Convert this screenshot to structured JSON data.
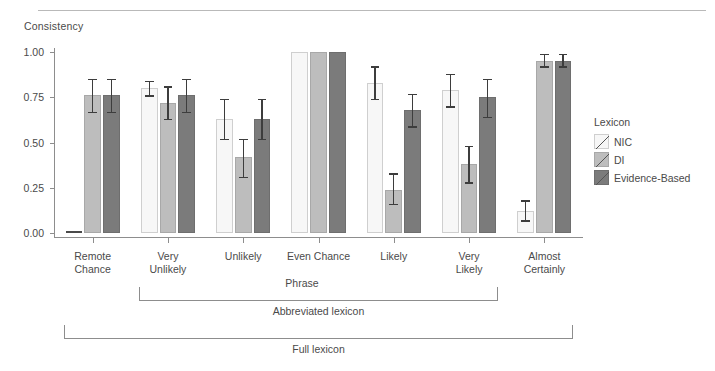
{
  "figure": {
    "top_fragment": "",
    "y_axis_title": "Consistency",
    "x_axis_title": "Phrase"
  },
  "legend": {
    "title": "Lexicon",
    "items": [
      {
        "label": "NIC",
        "color": "#f7f7f7",
        "key": "nic"
      },
      {
        "label": "DI",
        "color": "#bdbdbd",
        "key": "di"
      },
      {
        "label": "Evidence-Based",
        "color": "#7b7b7b",
        "key": "ev"
      }
    ]
  },
  "annotations": [
    {
      "label": "Abbreviated lexicon",
      "from_index": 1,
      "to_index": 5
    },
    {
      "label": "Full lexicon",
      "from_index": 0,
      "to_index": 6
    }
  ],
  "chart_data": {
    "type": "bar",
    "title": "",
    "xlabel": "Phrase",
    "ylabel": "Consistency",
    "ylim": [
      0,
      1.0
    ],
    "yticks": [
      0.0,
      0.25,
      0.5,
      0.75,
      1.0
    ],
    "ytick_labels": [
      "0.00",
      "0.25",
      "0.50",
      "0.75",
      "1.00"
    ],
    "grid": false,
    "legend_position": "right",
    "legend_title": "Lexicon",
    "categories": [
      "Remote Chance",
      "Very Unlikely",
      "Unlikely",
      "Even Chance",
      "Likely",
      "Very Likely",
      "Almost Certainly"
    ],
    "category_lines": [
      [
        "Remote",
        "Chance"
      ],
      [
        "Very",
        "Unlikely"
      ],
      [
        "Unlikely"
      ],
      [
        "Even Chance"
      ],
      [
        "Likely"
      ],
      [
        "Very",
        "Likely"
      ],
      [
        "Almost",
        "Certainly"
      ]
    ],
    "series": [
      {
        "name": "NIC",
        "color": "#f7f7f7",
        "values": [
          0.0,
          0.8,
          0.63,
          1.0,
          0.83,
          0.79,
          0.12
        ],
        "err_low": [
          0.0,
          0.76,
          0.52,
          1.0,
          0.74,
          0.7,
          0.07
        ],
        "err_high": [
          0.0,
          0.84,
          0.74,
          1.0,
          0.92,
          0.88,
          0.18
        ]
      },
      {
        "name": "DI",
        "color": "#bdbdbd",
        "values": [
          0.76,
          0.72,
          0.42,
          1.0,
          0.24,
          0.38,
          0.95
        ],
        "err_low": [
          0.67,
          0.63,
          0.31,
          1.0,
          0.16,
          0.28,
          0.92
        ],
        "err_high": [
          0.85,
          0.81,
          0.52,
          1.0,
          0.33,
          0.48,
          0.99
        ]
      },
      {
        "name": "Evidence-Based",
        "color": "#7b7b7b",
        "values": [
          0.76,
          0.76,
          0.63,
          1.0,
          0.68,
          0.75,
          0.95
        ],
        "err_low": [
          0.67,
          0.67,
          0.52,
          1.0,
          0.59,
          0.64,
          0.92
        ],
        "err_high": [
          0.85,
          0.85,
          0.74,
          1.0,
          0.77,
          0.85,
          0.99
        ]
      }
    ]
  }
}
